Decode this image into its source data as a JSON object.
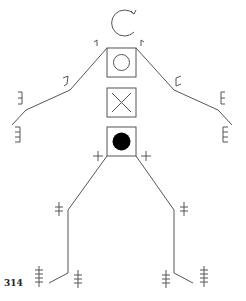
{
  "page": {
    "page_number": "314"
  },
  "figure": {
    "head_symbol": "open-circle-arrow",
    "trunk_boxes": [
      {
        "position": "chest",
        "symbol": "circle"
      },
      {
        "position": "abdomen",
        "symbol": "x-cross"
      },
      {
        "position": "pelvis",
        "symbol": "filled-circle"
      }
    ],
    "joint_marks": {
      "shoulders": "1 tick",
      "elbows": "2 ticks",
      "wrists": "3 ticks",
      "hands": "4 ticks",
      "hips": "1 cross",
      "knees": "2 crosses",
      "ankles": "3 crosses",
      "feet": "4 crosses"
    },
    "colors": {
      "line": "#555555",
      "fill": "#000000",
      "background": "#ffffff"
    }
  }
}
